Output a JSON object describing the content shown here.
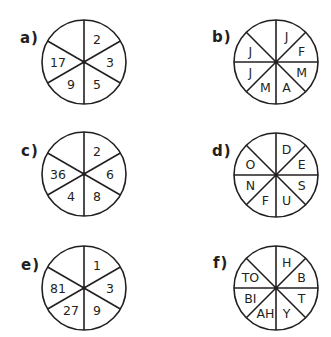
{
  "puzzles": [
    {
      "id": "a",
      "label": "a)",
      "segments": 6,
      "values": [
        "2",
        "3",
        "5",
        "9",
        "17",
        ""
      ],
      "label_pos": [
        20,
        31
      ],
      "center": [
        84,
        62
      ],
      "radius": 42
    },
    {
      "id": "b",
      "label": "b)",
      "segments": 8,
      "values": [
        "J",
        "F",
        "M",
        "A",
        "M",
        "J",
        "J",
        ""
      ],
      "label_pos": [
        212,
        30
      ],
      "center": [
        276,
        62
      ],
      "radius": 42
    },
    {
      "id": "c",
      "label": "c)",
      "segments": 6,
      "values": [
        "2",
        "6",
        "8",
        "4",
        "36",
        ""
      ],
      "label_pos": [
        21,
        144
      ],
      "center": [
        84,
        174
      ],
      "radius": 42
    },
    {
      "id": "d",
      "label": "d)",
      "segments": 8,
      "values": [
        "D",
        "E",
        "S",
        "U",
        "F",
        "N",
        "O",
        ""
      ],
      "label_pos": [
        212,
        144
      ],
      "center": [
        276,
        175
      ],
      "radius": 42
    },
    {
      "id": "e",
      "label": "e)",
      "segments": 6,
      "values": [
        "1",
        "3",
        "9",
        "27",
        "81",
        ""
      ],
      "label_pos": [
        21,
        258
      ],
      "center": [
        84,
        288
      ],
      "radius": 42
    },
    {
      "id": "f",
      "label": "f)",
      "segments": 8,
      "values": [
        "H",
        "B",
        "T",
        "Y",
        "AH",
        "BI",
        "TO",
        ""
      ],
      "label_pos": [
        213,
        256
      ],
      "center": [
        276,
        288
      ],
      "radius": 42
    }
  ],
  "colors": {
    "ink": "#231f20",
    "background": "#ffffff"
  }
}
